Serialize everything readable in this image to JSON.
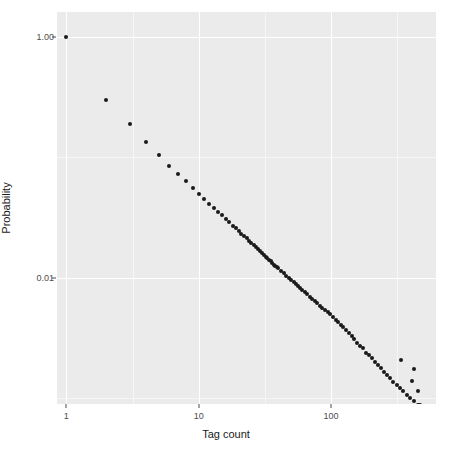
{
  "chart_data": {
    "type": "scatter",
    "title": "",
    "xlabel": "Tag count",
    "ylabel": "Probability",
    "xscale": "log",
    "yscale": "log",
    "xlim": [
      0.85,
      620
    ],
    "ylim": [
      0.0009,
      1.6
    ],
    "grid": true,
    "legend": null,
    "x_ticks": [
      {
        "value": 1,
        "label": "1"
      },
      {
        "value": 10,
        "label": "10"
      },
      {
        "value": 100,
        "label": "100"
      }
    ],
    "y_ticks": [
      {
        "value": 1.0,
        "label": "1.00"
      },
      {
        "value": 0.01,
        "label": "0.01"
      }
    ],
    "point_color": "#1a1a1a",
    "panel_color": "#ebebeb",
    "grid_color": "#ffffff",
    "series": [
      {
        "name": "Tag count distribution",
        "x": [
          1,
          2,
          3,
          4,
          5,
          6,
          7,
          8,
          9,
          10,
          11,
          12,
          13,
          14,
          15,
          16,
          17,
          18,
          19,
          20,
          21,
          22,
          23,
          24,
          25,
          26,
          27,
          28,
          29,
          30,
          31,
          32,
          33,
          34,
          35,
          36,
          37,
          38,
          39,
          40,
          42,
          44,
          46,
          48,
          50,
          52,
          54,
          56,
          58,
          60,
          63,
          66,
          69,
          72,
          75,
          78,
          82,
          86,
          90,
          94,
          98,
          103,
          108,
          113,
          118,
          124,
          130,
          136,
          143,
          150,
          158,
          166,
          175,
          184,
          193,
          203,
          214,
          225,
          237,
          250,
          264,
          279,
          295,
          312,
          330,
          350,
          372,
          396,
          422,
          450,
          480,
          512,
          548,
          586
        ],
        "y": [
          1.0,
          0.3,
          0.19,
          0.135,
          0.104,
          0.085,
          0.072,
          0.063,
          0.056,
          0.05,
          0.045,
          0.041,
          0.038,
          0.035,
          0.033,
          0.031,
          0.029,
          0.027,
          0.026,
          0.0245,
          0.0232,
          0.0222,
          0.0212,
          0.0203,
          0.0194,
          0.0186,
          0.0179,
          0.0172,
          0.0166,
          0.016,
          0.0155,
          0.015,
          0.0145,
          0.0141,
          0.0137,
          0.0133,
          0.0129,
          0.0126,
          0.0123,
          0.012,
          0.0114,
          0.0109,
          0.0104,
          0.01,
          0.0096,
          0.0092,
          0.0089,
          0.0086,
          0.0083,
          0.008,
          0.0076,
          0.0073,
          0.007,
          0.0067,
          0.0064,
          0.0062,
          0.0059,
          0.0056,
          0.0054,
          0.0052,
          0.005,
          0.0047,
          0.0045,
          0.0043,
          0.0041,
          0.0039,
          0.0037,
          0.0035,
          0.0033,
          0.0031,
          0.0029,
          0.0027,
          0.0026,
          0.0024,
          0.0023,
          0.00215,
          0.00202,
          0.0019,
          0.00178,
          0.00167,
          0.00157,
          0.00147,
          0.00138,
          0.0013,
          0.00122,
          0.00115,
          0.00107,
          0.00101,
          0.00095,
          0.00089,
          0.00084,
          0.00078,
          0.00074,
          0.0007
        ]
      }
    ],
    "tail_points": {
      "x": [
        340,
        420,
        408,
        455,
        470,
        500
      ],
      "y": [
        0.0021,
        0.00175,
        0.0014,
        0.00115,
        0.00088,
        0.00058
      ]
    }
  },
  "axis": {
    "x_title": "Tag count",
    "y_title": "Probability",
    "x_tick_labels": [
      "1",
      "10",
      "100"
    ],
    "y_tick_labels": [
      "1.00",
      "0.01"
    ]
  }
}
